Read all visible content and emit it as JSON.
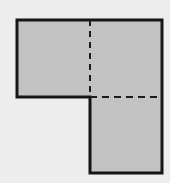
{
  "figure": {
    "shape_name": "l-shape-polygon",
    "canvas": {
      "width": 170,
      "height": 183
    },
    "colors": {
      "background": "#efefef",
      "fill": "#c4c4c4",
      "outline": "#141414",
      "dashed_line": "#1a1a1a"
    },
    "outline": {
      "stroke_width": 3,
      "points": "17,20 162,20 162,173 90,173 90,97 17,97",
      "vertices": [
        {
          "label": "top-left",
          "x": 17,
          "y": 20
        },
        {
          "label": "top-right",
          "x": 162,
          "y": 20
        },
        {
          "label": "bottom-right",
          "x": 162,
          "y": 173
        },
        {
          "label": "bottom-inner-left",
          "x": 90,
          "y": 173
        },
        {
          "label": "notch-corner",
          "x": 90,
          "y": 97
        },
        {
          "label": "left-lower",
          "x": 17,
          "y": 97
        }
      ]
    },
    "dashed_lines": [
      {
        "name": "vertical-divider",
        "orientation": "vertical",
        "x1": 90,
        "y1": 20,
        "x2": 90,
        "y2": 97,
        "stroke_width": 2,
        "dash_pattern": "6 5"
      },
      {
        "name": "horizontal-divider",
        "orientation": "horizontal",
        "x1": 90,
        "y1": 97,
        "x2": 162,
        "y2": 97,
        "stroke_width": 2,
        "dash_pattern": "7 5"
      }
    ],
    "regions": [
      {
        "name": "upper-left-rectangle",
        "x": 17,
        "y": 20,
        "width": 73,
        "height": 77
      },
      {
        "name": "upper-right-rectangle",
        "x": 90,
        "y": 20,
        "width": 72,
        "height": 77
      },
      {
        "name": "lower-right-rectangle",
        "x": 90,
        "y": 97,
        "width": 72,
        "height": 76
      }
    ]
  }
}
